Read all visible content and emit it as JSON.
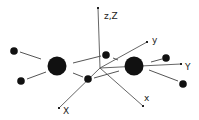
{
  "diagram": {
    "type": "molecular-geometry-with-axes",
    "axes": [
      {
        "id": "z",
        "label": "z,Z",
        "from": [
          100,
          68
        ],
        "to": [
          98,
          8
        ],
        "label_pos": [
          104,
          19
        ]
      },
      {
        "id": "y",
        "label": "y",
        "from": [
          100,
          68
        ],
        "to": [
          147,
          42
        ],
        "label_pos": [
          152,
          43
        ]
      },
      {
        "id": "Y",
        "label": "Y",
        "from": [
          100,
          68
        ],
        "to": [
          181,
          64
        ],
        "label_pos": [
          185,
          70
        ]
      },
      {
        "id": "x",
        "label": "x",
        "from": [
          100,
          68
        ],
        "to": [
          143,
          106
        ],
        "label_pos": [
          144,
          101
        ]
      },
      {
        "id": "X",
        "label": "X",
        "from": [
          100,
          68
        ],
        "to": [
          59,
          108
        ],
        "label_pos": [
          63,
          114
        ]
      }
    ],
    "atoms": [
      {
        "id": "heavy-left",
        "kind": "large",
        "cx": 57,
        "cy": 66,
        "r": 9.5
      },
      {
        "id": "heavy-right",
        "kind": "large",
        "cx": 134,
        "cy": 66,
        "r": 9.5
      },
      {
        "id": "h1",
        "kind": "small",
        "cx": 14,
        "cy": 51,
        "r": 3.8
      },
      {
        "id": "h2",
        "kind": "small",
        "cx": 21,
        "cy": 81,
        "r": 3.8
      },
      {
        "id": "h3",
        "kind": "small",
        "cx": 106,
        "cy": 55,
        "r": 3.8
      },
      {
        "id": "h4",
        "kind": "small",
        "cx": 88,
        "cy": 79,
        "r": 3.8
      },
      {
        "id": "h5",
        "kind": "small",
        "cx": 166,
        "cy": 58,
        "r": 3.8
      },
      {
        "id": "h6",
        "kind": "small",
        "cx": 183,
        "cy": 84,
        "r": 3.8
      }
    ],
    "bonds": [
      {
        "from": [
          20,
          52
        ],
        "to": [
          41,
          59
        ]
      },
      {
        "from": [
          27,
          79
        ],
        "to": [
          46,
          72
        ]
      },
      {
        "from": [
          73,
          63
        ],
        "to": [
          101,
          56
        ]
      },
      {
        "from": [
          73,
          73
        ],
        "to": [
          83,
          77
        ]
      },
      {
        "from": [
          113,
          58
        ],
        "to": [
          118,
          60
        ]
      },
      {
        "from": [
          94,
          78
        ],
        "to": [
          119,
          71
        ]
      },
      {
        "from": [
          151,
          62
        ],
        "to": [
          162,
          59
        ]
      },
      {
        "from": [
          149,
          70
        ],
        "to": [
          178,
          81
        ]
      }
    ],
    "colors": {
      "atom": "#111111",
      "line": "#555555",
      "label": "#222222"
    }
  }
}
